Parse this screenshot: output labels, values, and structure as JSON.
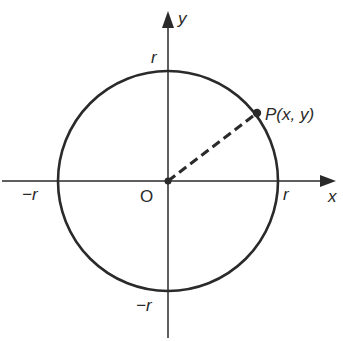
{
  "diagram": {
    "type": "circle-on-cartesian-plane",
    "colors": {
      "stroke": "#2a2a2a",
      "background": "#ffffff"
    },
    "axes": {
      "x_label": "x",
      "y_label": "y"
    },
    "origin_label": "O",
    "radius_labels": {
      "top": "r",
      "right": "r",
      "left": "−r",
      "bottom": "−r"
    },
    "point": {
      "label": "P(x, y)"
    },
    "radius_line_style": "dashed"
  }
}
